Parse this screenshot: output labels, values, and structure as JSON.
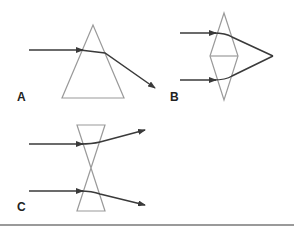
{
  "figure": {
    "panels": [
      {
        "id": "A",
        "label": "A",
        "element": "prism",
        "description": "Single triangular prism refracting a ray downward toward base"
      },
      {
        "id": "B",
        "label": "B",
        "element": "convex-lens (two prisms base-to-base)",
        "description": "Two parallel rays converge to a focal point"
      },
      {
        "id": "C",
        "label": "C",
        "element": "concave-lens (two prisms apex-to-apex)",
        "description": "Two parallel rays diverge"
      }
    ]
  },
  "colors": {
    "prism_stroke": "#9a9a9a",
    "ray": "#3a3a3a",
    "label": "#222222",
    "divider": "#9a9a9a"
  }
}
